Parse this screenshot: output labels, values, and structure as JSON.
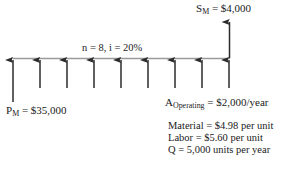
{
  "diagram": {
    "type": "cash-flow-diagram",
    "timeline": {
      "periods": 9,
      "baseline_y": 58,
      "start_x": 13,
      "end_x": 230,
      "tick_spacing": 27
    },
    "labels": {
      "salvage": {
        "symbol": "S",
        "subscript": "M",
        "equals": "= $4,000",
        "full": "S_M = $4,000"
      },
      "period": {
        "full": "n = 8, i = 20%",
        "n": 8,
        "i": "20%"
      },
      "principal": {
        "symbol": "P",
        "subscript": "M",
        "equals": "= $35,000",
        "full": "P_M = $35,000"
      },
      "operating": {
        "symbol": "A",
        "subscript": "Operating",
        "equals": "= $2,000/year",
        "full": "A_Operating = $2,000/year"
      }
    },
    "cost_lines": [
      "Material = $4.98 per unit",
      "Labor = $5.60 per unit",
      "Q = 5,000 units per year"
    ],
    "colors": {
      "stroke": "#2b2b2b",
      "baseline": "#8a8a8a",
      "text": "#1a1a1a",
      "background": "#ffffff"
    }
  }
}
